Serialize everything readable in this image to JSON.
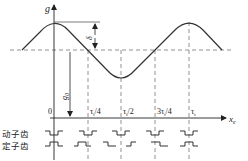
{
  "diagram": {
    "y_axis_label": "g",
    "x_axis_label": "x",
    "x_axis_label_sub": "e",
    "delta_label": "δ",
    "g0_label": "g",
    "g0_label_sub": "0",
    "ticks": [
      {
        "label": "0",
        "x": 52
      },
      {
        "label": "τ",
        "sub": "t",
        "tail": "/4",
        "x": 88
      },
      {
        "label": "τ",
        "sub": "t",
        "tail": "/2",
        "x": 121
      },
      {
        "label": "3τ",
        "sub": "t",
        "tail": "/4",
        "x": 155
      },
      {
        "label": "τ",
        "sub": "t",
        "tail": "",
        "x": 189
      }
    ],
    "rows": {
      "mover_teeth": "动子齿",
      "stator_teeth": "定子齿"
    },
    "colors": {
      "line": "#333333",
      "dashed": "#777777"
    }
  }
}
